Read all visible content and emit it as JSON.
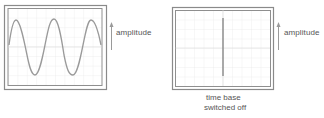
{
  "diagram": {
    "panels": [
      {
        "id": "sine-trace",
        "trace": "sine wave",
        "cycles": 2.5,
        "axis_label": "amplitude",
        "caption": null
      },
      {
        "id": "vertical-line-trace",
        "trace": "vertical line",
        "axis_label": "amplitude",
        "caption_lines": [
          "time base",
          "switched off"
        ]
      }
    ],
    "labels": {
      "left_amplitude": "amplitude",
      "right_amplitude": "amplitude",
      "caption_line1": "time base",
      "caption_line2": "switched off"
    },
    "colors": {
      "frame": "#8a8a8a",
      "grid": "#e2e2e2",
      "trace": "#9a9a9a",
      "text": "#555555"
    }
  }
}
